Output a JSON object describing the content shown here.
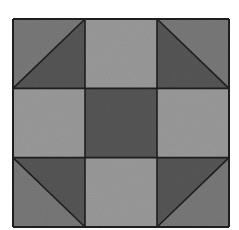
{
  "figure": {
    "type": "quilt-block",
    "pattern": "shoo-fly",
    "grid": {
      "rows": 3,
      "cols": 3
    },
    "colors": {
      "outline": "#1e1e1e",
      "light": "#9c9c9c",
      "dark": "#575757",
      "speckled": "#7a7a7a",
      "background": "#ffffff"
    },
    "cells": [
      {
        "row": 0,
        "col": 0,
        "kind": "half-square-triangle",
        "diagonal": "bl-tr",
        "outer": "speckled",
        "inner": "dark"
      },
      {
        "row": 0,
        "col": 1,
        "kind": "square",
        "fill": "light"
      },
      {
        "row": 0,
        "col": 2,
        "kind": "half-square-triangle",
        "diagonal": "tl-br",
        "outer": "speckled",
        "inner": "dark"
      },
      {
        "row": 1,
        "col": 0,
        "kind": "square",
        "fill": "light"
      },
      {
        "row": 1,
        "col": 1,
        "kind": "square",
        "fill": "dark"
      },
      {
        "row": 1,
        "col": 2,
        "kind": "square",
        "fill": "light"
      },
      {
        "row": 2,
        "col": 0,
        "kind": "half-square-triangle",
        "diagonal": "tl-br",
        "outer": "speckled",
        "inner": "dark"
      },
      {
        "row": 2,
        "col": 1,
        "kind": "square",
        "fill": "light"
      },
      {
        "row": 2,
        "col": 2,
        "kind": "half-square-triangle",
        "diagonal": "bl-tr",
        "outer": "speckled",
        "inner": "dark"
      }
    ]
  }
}
